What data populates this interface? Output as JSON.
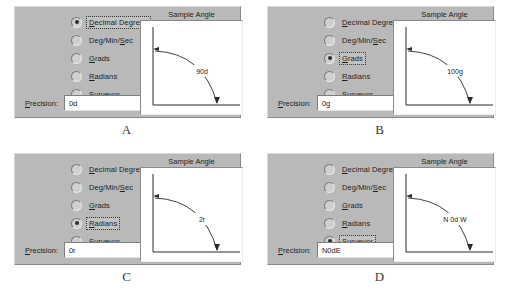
{
  "panels": [
    {
      "letter": "A",
      "selected_index": 1,
      "options": [
        {
          "label": "Decimal Degrees",
          "accel_index": 0
        },
        {
          "label": "Deg/Min/Sec",
          "accel_index": 8
        },
        {
          "label": "Grads",
          "accel_index": 0
        },
        {
          "label": "Radians",
          "accel_index": 0
        },
        {
          "label": "Surveyor",
          "accel_index": 3
        }
      ],
      "precision": {
        "label": "Precision:",
        "value": "0d"
      },
      "sample": {
        "title": "Sample Angle",
        "angle_label": "90d"
      }
    },
    {
      "letter": "B",
      "selected_index": 2,
      "options": [
        {
          "label": "Decimal Degrees",
          "accel_index": 0
        },
        {
          "label": "Deg/Min/Sec",
          "accel_index": 8
        },
        {
          "label": "Grads",
          "accel_index": 0
        },
        {
          "label": "Radians",
          "accel_index": 0
        },
        {
          "label": "Surveyor",
          "accel_index": 3
        }
      ],
      "precision": {
        "label": "Precision:",
        "value": "0g"
      },
      "sample": {
        "title": "Sample Angle",
        "angle_label": "100g"
      }
    },
    {
      "letter": "C",
      "selected_index": 3,
      "options": [
        {
          "label": "Decimal Degrees",
          "accel_index": 0
        },
        {
          "label": "Deg/Min/Sec",
          "accel_index": 8
        },
        {
          "label": "Grads",
          "accel_index": 0
        },
        {
          "label": "Radians",
          "accel_index": 0
        },
        {
          "label": "Surveyor",
          "accel_index": 3
        }
      ],
      "precision": {
        "label": "Precision:",
        "value": "0r"
      },
      "sample": {
        "title": "Sample Angle",
        "angle_label": "2r"
      }
    },
    {
      "letter": "D",
      "selected_index": 4,
      "options": [
        {
          "label": "Decimal Degrees",
          "accel_index": 0
        },
        {
          "label": "Deg/Min/Sec",
          "accel_index": 8
        },
        {
          "label": "Grads",
          "accel_index": 0
        },
        {
          "label": "Radians",
          "accel_index": 0
        },
        {
          "label": "Surveyor",
          "accel_index": 3
        }
      ],
      "precision": {
        "label": "Precision:",
        "value": "N0dE"
      },
      "sample": {
        "title": "Sample Angle",
        "angle_label": "N 0d W"
      }
    }
  ],
  "colors": {
    "dialog_face": "#b9b9b9",
    "page_background": "#ffffff",
    "sample_background": "#ffffff",
    "text": "#1e1e1e"
  }
}
